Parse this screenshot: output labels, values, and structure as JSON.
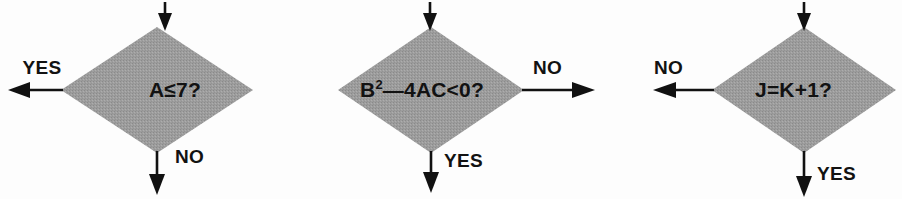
{
  "figure": {
    "background_color": "#fdfdfd",
    "diamond_fill_color": "#9a9a9a",
    "line_color": "#111111",
    "text_color": "#121212"
  },
  "nodes": [
    {
      "id": "decision-a",
      "condition": "A≤7?",
      "condition_base": "A≤7?",
      "condition_sup": "",
      "center_x": 157,
      "center_y": 90,
      "half_width": 96,
      "half_height": 63,
      "text_x": 175,
      "inlet": {
        "label": "",
        "direction": "down",
        "x": 165
      },
      "branches": [
        {
          "label": "YES",
          "direction": "left",
          "label_x": 42,
          "label_y": 74
        },
        {
          "label": "NO",
          "direction": "down",
          "label_x": 175,
          "label_y": 163
        }
      ]
    },
    {
      "id": "decision-b",
      "condition": "B²—4AC<0?",
      "condition_base": "—4AC<0?",
      "condition_sup": "2",
      "center_x": 431,
      "center_y": 90,
      "half_width": 93,
      "half_height": 63,
      "text_x": 360,
      "inlet": {
        "label": "",
        "direction": "down",
        "x": 430
      },
      "branches": [
        {
          "label": "NO",
          "direction": "right",
          "label_x": 533,
          "label_y": 74
        },
        {
          "label": "YES",
          "direction": "down",
          "label_x": 444,
          "label_y": 167
        }
      ]
    },
    {
      "id": "decision-c",
      "condition": "J=K+1?",
      "condition_base": "J=K+1?",
      "condition_sup": "",
      "center_x": 804,
      "center_y": 90,
      "half_width": 92,
      "half_height": 63,
      "text_x": 755,
      "inlet": {
        "label": "",
        "direction": "down",
        "x": 804
      },
      "branches": [
        {
          "label": "NO",
          "direction": "left",
          "label_x": 654,
          "label_y": 74
        },
        {
          "label": "YES",
          "direction": "down",
          "label_x": 817,
          "label_y": 180
        }
      ]
    }
  ]
}
